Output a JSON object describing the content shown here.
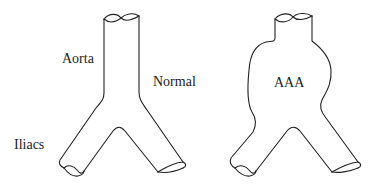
{
  "labels": {
    "aorta": "Aorta",
    "normal": "Normal",
    "iliacs": "Iliacs",
    "aaa": "AAA"
  },
  "colors": {
    "stroke": "#222222",
    "background": "#ffffff"
  }
}
